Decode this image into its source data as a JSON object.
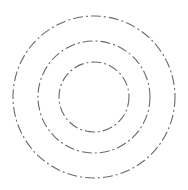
{
  "diagram": {
    "type": "concentric-circles",
    "background": "#ffffff",
    "stroke_color": "#6a6a6a",
    "dash_pattern": "10 3 2 3",
    "center": {
      "x": 94,
      "y": 97
    },
    "circles": [
      {
        "name": "outer",
        "r": 81
      },
      {
        "name": "middle",
        "r": 56
      },
      {
        "name": "inner",
        "r": 35
      }
    ]
  }
}
